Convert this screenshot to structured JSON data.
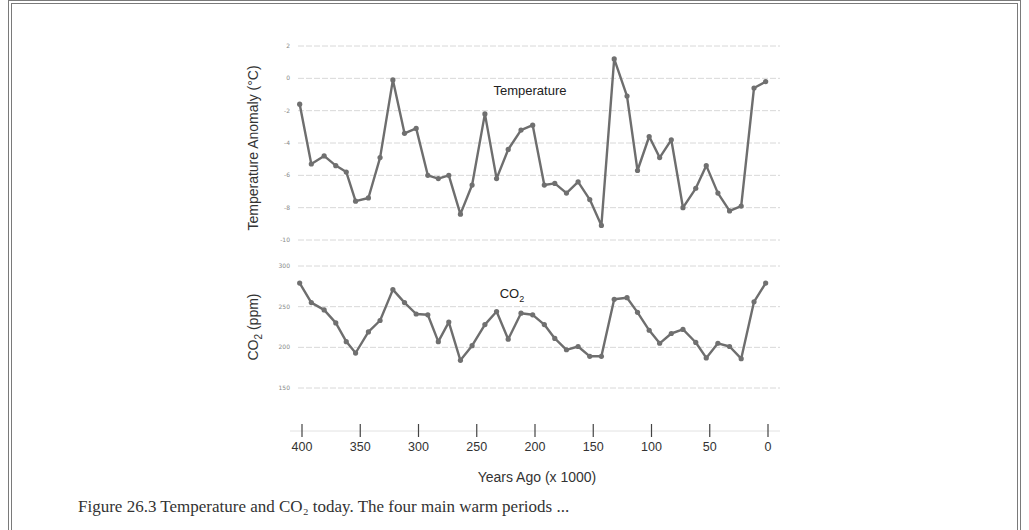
{
  "chart_data": [
    {
      "type": "line",
      "title": "Temperature",
      "ylabel": "Temperature Anomaly (°C)",
      "xlabel": "Years Ago (x 1000)",
      "ylim": [
        -10,
        2
      ],
      "yticks": [
        2,
        0,
        -2,
        -4,
        -6,
        -8,
        -10
      ],
      "grid": true,
      "series": [
        {
          "name": "Temperature",
          "x": [
            402,
            392,
            381,
            371,
            362,
            354,
            343,
            333,
            322,
            312,
            302,
            292,
            283,
            274,
            264,
            254,
            243,
            233,
            223,
            212,
            202,
            192,
            183,
            173,
            163,
            153,
            143,
            132,
            121,
            112,
            102,
            93,
            83,
            73,
            62,
            53,
            43,
            33,
            23,
            12,
            2
          ],
          "values": [
            -1.6,
            -5.3,
            -4.8,
            -5.4,
            -5.8,
            -7.6,
            -7.4,
            -4.9,
            -0.1,
            -3.4,
            -3.1,
            -6.0,
            -6.2,
            -6.0,
            -8.4,
            -6.6,
            -2.2,
            -6.2,
            -4.4,
            -3.2,
            -2.9,
            -6.6,
            -6.5,
            -7.1,
            -6.4,
            -7.5,
            -9.1,
            1.2,
            -1.1,
            -5.7,
            -3.6,
            -4.9,
            -3.8,
            -8.0,
            -6.8,
            -5.4,
            -7.1,
            -8.2,
            -7.9,
            -0.6,
            -0.2
          ]
        }
      ]
    },
    {
      "type": "line",
      "title": "CO2",
      "ylabel": "CO2 (ppm)",
      "xlabel": "Years Ago (x 1000)",
      "ylim": [
        150,
        300
      ],
      "yticks": [
        300,
        250,
        200,
        150
      ],
      "grid": true,
      "series": [
        {
          "name": "CO2",
          "x": [
            402,
            392,
            381,
            371,
            362,
            354,
            343,
            333,
            322,
            312,
            302,
            292,
            283,
            274,
            264,
            254,
            243,
            233,
            223,
            212,
            202,
            192,
            183,
            173,
            163,
            153,
            143,
            132,
            121,
            112,
            102,
            93,
            83,
            73,
            62,
            53,
            43,
            33,
            23,
            12,
            2
          ],
          "values": [
            279,
            255,
            246,
            230,
            207,
            193,
            219,
            233,
            271,
            255,
            241,
            240,
            207,
            231,
            184,
            202,
            228,
            244,
            210,
            242,
            240,
            228,
            211,
            197,
            201,
            189,
            189,
            259,
            261,
            243,
            221,
            205,
            217,
            222,
            206,
            187,
            205,
            201,
            186,
            256,
            279
          ]
        }
      ]
    }
  ],
  "x_axis": {
    "label": "Years Ago (x 1000)",
    "ticks": [
      "400",
      "350",
      "300",
      "250",
      "200",
      "150",
      "100",
      "50",
      "0"
    ],
    "tick_values": [
      400,
      350,
      300,
      250,
      200,
      150,
      100,
      50,
      0
    ],
    "reversed": true
  },
  "temp_panel": {
    "ylabel": "Temperature Anomaly  (°C)",
    "series_label": "Temperature",
    "tick_labels": [
      "2",
      "0",
      "-2",
      "-4",
      "-6",
      "-8",
      "-10"
    ]
  },
  "co2_panel": {
    "ylabel_main": "CO",
    "ylabel_sub": "2",
    "ylabel_tail": "  (ppm)",
    "series_label_main": "CO",
    "series_label_sub": "2",
    "tick_labels": [
      "300",
      "250",
      "200",
      "150"
    ]
  },
  "caption": "Figure 26.3  Temperature and CO₂ today. The four main warm periods ...",
  "colors": {
    "line": "#6e6e6e",
    "marker": "#707070",
    "grid": "#d8d8d8",
    "text": "#333333",
    "border": "#7a7a7a"
  }
}
